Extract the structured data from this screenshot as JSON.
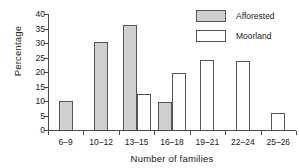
{
  "chart_data": {
    "type": "bar",
    "title": "",
    "subtitle": "",
    "xlabel": "Number of families",
    "ylabel": "Percentage",
    "categories": [
      "6–9",
      "10–12",
      "13–15",
      "16–18",
      "19–21",
      "22–24",
      "25–26"
    ],
    "series": [
      {
        "name": "Afforested",
        "color": "#cfcfcf",
        "values": [
          10.0,
          30.5,
          36.3,
          9.8,
          0,
          0,
          0
        ]
      },
      {
        "name": "Moorland",
        "color": "#ffffff",
        "values": [
          0,
          0,
          12.4,
          19.6,
          24.2,
          23.8,
          5.8
        ]
      }
    ],
    "ylim": [
      0,
      40
    ],
    "yticks": [
      0,
      5,
      10,
      15,
      20,
      25,
      30,
      35,
      40
    ],
    "ytick_labels": [
      "0",
      "5",
      "10",
      "15",
      "20",
      "25",
      "30",
      "35",
      "40"
    ],
    "grid": false,
    "legend_position": "top-right",
    "annotations": []
  },
  "legend": {
    "items": [
      {
        "label": "Afforested",
        "swatch": "filled-gray-swatch"
      },
      {
        "label": "Moorland",
        "swatch": "outline-white-swatch"
      }
    ]
  }
}
